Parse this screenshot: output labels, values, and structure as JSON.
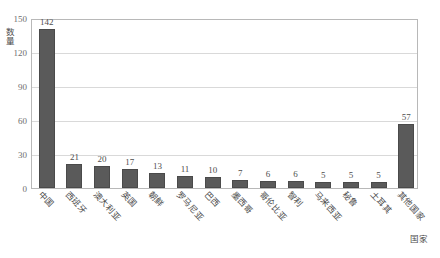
{
  "top_clipped_text": "",
  "chart_data": {
    "type": "bar",
    "title": "",
    "xlabel": "国家",
    "ylabel": "数量",
    "ylim": [
      0,
      150
    ],
    "ytick_labels": [
      "0",
      "30",
      "60",
      "90",
      "120",
      "150"
    ],
    "ytick_values": [
      0,
      30,
      60,
      90,
      120,
      150
    ],
    "grid": true,
    "legend": false,
    "bar_color": "#5a5a5a",
    "categories": [
      "中国",
      "西班牙",
      "澳大利亚",
      "英国",
      "朝鲜",
      "罗马尼亚",
      "巴西",
      "墨西哥",
      "哥伦比亚",
      "智利",
      "马来西亚",
      "秘鲁",
      "土耳其",
      "其他国家"
    ],
    "values": [
      142,
      21,
      20,
      17,
      13,
      11,
      10,
      7,
      6,
      6,
      5,
      5,
      5,
      57
    ],
    "data_labels": [
      "142",
      "21",
      "20",
      "17",
      "13",
      "11",
      "10",
      "7",
      "6",
      "6",
      "5",
      "5",
      "5",
      "57"
    ]
  }
}
